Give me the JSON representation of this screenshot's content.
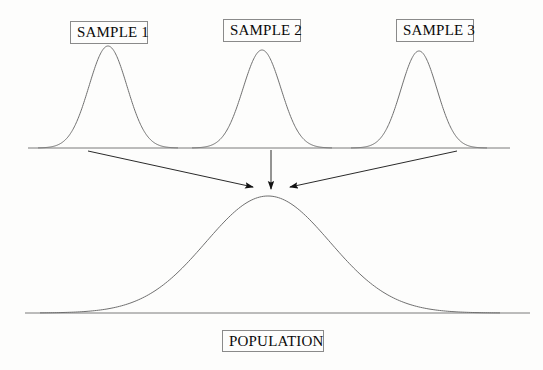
{
  "figure": {
    "title_implied": "Sampling from a population",
    "background_color": "#fdfdfc",
    "line_color": "#6b6b6b",
    "arrow_color": "#1a1a1a",
    "text_color": "#0a0a0a",
    "box_border_color": "#8a8a8a"
  },
  "labels": {
    "sample_1": "SAMPLE 1",
    "sample_2": "SAMPLE 2",
    "sample_3": "SAMPLE 3",
    "population": "POPULATION"
  },
  "chart_data": {
    "type": "line",
    "title": "",
    "xlabel": "",
    "ylabel": "",
    "grid": false,
    "legend": "none",
    "axis_lines": [
      {
        "name": "sample-baseline",
        "x_start": 28,
        "x_end": 510,
        "y": 148
      },
      {
        "name": "population-baseline",
        "x_start": 25,
        "x_end": 530,
        "y": 313
      }
    ],
    "series": [
      {
        "name": "SAMPLE 1",
        "distribution": "normal",
        "peak_x": 108,
        "peak_y": 46,
        "baseline_y": 148,
        "sigma_px": 19,
        "height_px": 102,
        "x_range": [
          38,
          178
        ]
      },
      {
        "name": "SAMPLE 2",
        "distribution": "normal",
        "peak_x": 262,
        "peak_y": 50,
        "baseline_y": 148,
        "sigma_px": 19,
        "height_px": 98,
        "x_range": [
          192,
          332
        ]
      },
      {
        "name": "SAMPLE 3",
        "distribution": "normal",
        "peak_x": 419,
        "peak_y": 51,
        "baseline_y": 148,
        "sigma_px": 18,
        "height_px": 97,
        "x_range": [
          351,
          487
        ]
      },
      {
        "name": "POPULATION",
        "distribution": "normal",
        "peak_x": 268,
        "peak_y": 196,
        "baseline_y": 313,
        "sigma_px": 62,
        "height_px": 117,
        "x_range": [
          40,
          500
        ]
      }
    ],
    "arrows": [
      {
        "name": "arrow-sample-1-to-population",
        "x1": 88,
        "y1": 151,
        "x2": 253,
        "y2": 187
      },
      {
        "name": "arrow-sample-2-to-population",
        "x1": 271,
        "y1": 150,
        "x2": 271,
        "y2": 189
      },
      {
        "name": "arrow-sample-3-to-population",
        "x1": 457,
        "y1": 151,
        "x2": 290,
        "y2": 187
      }
    ]
  }
}
